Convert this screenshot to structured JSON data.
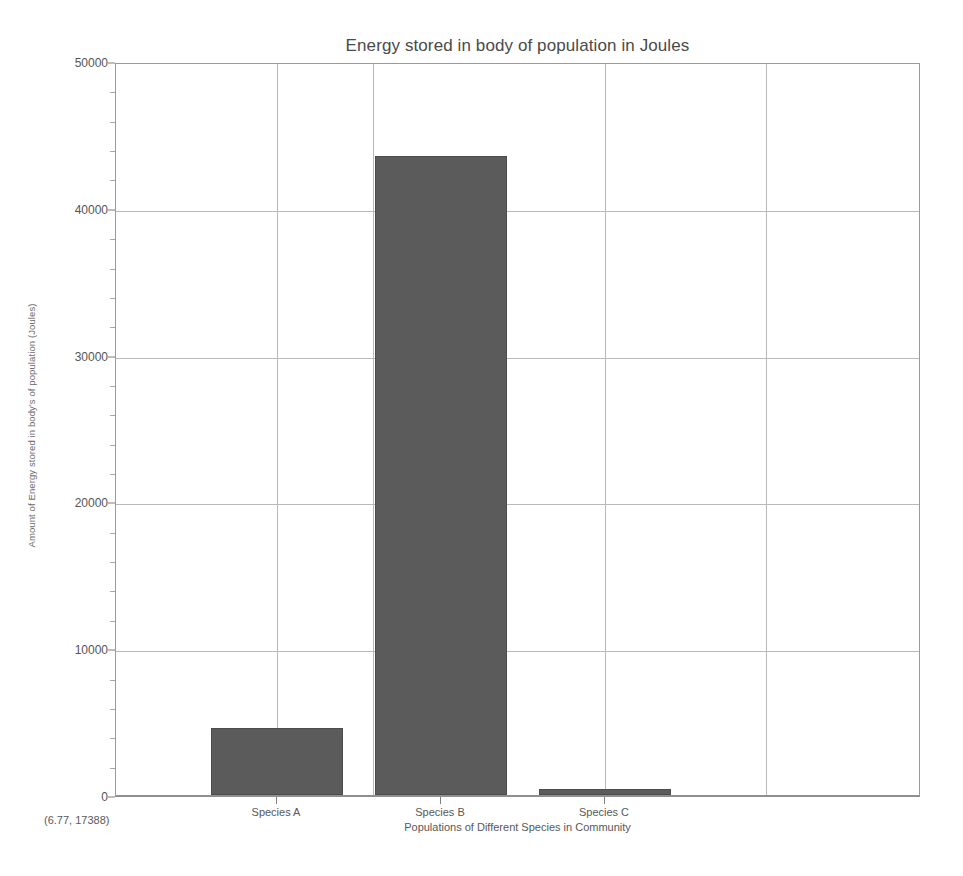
{
  "chart_data": {
    "type": "bar",
    "title": "Energy stored in body of population in Joules",
    "xlabel": "Populations of Different Species in Community",
    "ylabel": "Amount of Energy stored in body's of population (Joules)",
    "categories": [
      "Species A",
      "Species B",
      "Species C"
    ],
    "values": [
      4560,
      43550,
      400
    ],
    "series": [
      {
        "name": "Energy stored (Joules)",
        "values": [
          4560,
          43550,
          400
        ]
      }
    ],
    "ylim": [
      0,
      50000
    ],
    "yticks": [
      0,
      10000,
      20000,
      30000,
      40000,
      50000
    ],
    "ytick_labels": [
      "0",
      "10000",
      "20000",
      "30000",
      "40000",
      "50000"
    ],
    "grid": true,
    "legend": false,
    "legend_position": "none",
    "bar_color": "#5b5b5b",
    "background_color": "#ffffff",
    "grid_color": "#b9b9b9",
    "axis_color": "#9a9a9a"
  },
  "status": {
    "coordinate_readout": "(6.77, 17388)"
  }
}
